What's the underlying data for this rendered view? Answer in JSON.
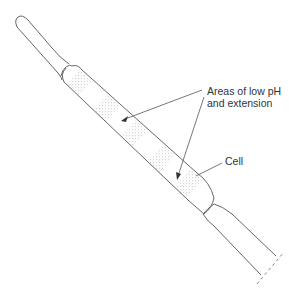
{
  "diagram": {
    "title": "",
    "labels": {
      "areas": {
        "line1": "Areas of low pH",
        "line2": "and extension"
      },
      "cell": "Cell"
    },
    "colors": {
      "outline": "#555555",
      "stipple": "#8a8a8a",
      "text": "#333333"
    }
  }
}
